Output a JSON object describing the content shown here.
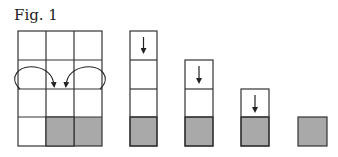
{
  "figure": {
    "title": "Fig. 1",
    "fill_color": "#a9a9a9",
    "line_color": "#333333",
    "grid": {
      "columns": 3,
      "rows": 4,
      "shaded_cell": {
        "row": 4,
        "column": 2
      },
      "curved_arrows": [
        {
          "from": "left column, row 2",
          "to": "middle column, row 2"
        },
        {
          "from": "right column, row 2",
          "to": "middle column, row 2"
        }
      ]
    },
    "stacks": [
      {
        "height": 4,
        "shaded_bottom": true,
        "down_arrow_in_top": true
      },
      {
        "height": 3,
        "shaded_bottom": true,
        "down_arrow_in_top": true
      },
      {
        "height": 2,
        "shaded_bottom": true,
        "down_arrow_in_top": true
      },
      {
        "height": 1,
        "shaded_bottom": true,
        "down_arrow_in_top": false
      }
    ]
  }
}
